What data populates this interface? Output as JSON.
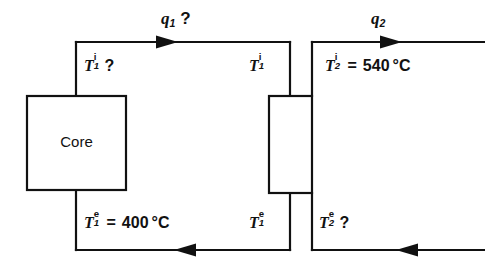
{
  "diagram": {
    "stroke_color": "#111111",
    "background_color": "#ffffff",
    "blocks": [
      {
        "id": "core",
        "label": "Core"
      },
      {
        "id": "heat-exchanger",
        "label": ""
      }
    ],
    "flow_labels": [
      {
        "id": "q1",
        "symbol": "q",
        "subscript": "1",
        "suffix": "?",
        "text": "q1 ?"
      },
      {
        "id": "q2",
        "symbol": "q",
        "subscript": "2",
        "suffix": "",
        "text": "q2"
      }
    ],
    "temperature_labels": [
      {
        "id": "t1-inlet-core",
        "symbol": "T",
        "superscript": "i",
        "subscript": "1",
        "equals": "",
        "value": "",
        "unit": "",
        "suffix": "?",
        "text": "T1i ?"
      },
      {
        "id": "t1-inlet-hx",
        "symbol": "T",
        "superscript": "i",
        "subscript": "1",
        "equals": "",
        "value": "",
        "unit": "",
        "suffix": "",
        "text": "T1i"
      },
      {
        "id": "t2-inlet",
        "symbol": "T",
        "superscript": "i",
        "subscript": "2",
        "equals": "=",
        "value": "540",
        "unit": "°C",
        "suffix": "",
        "text": "T2i = 540 °C"
      },
      {
        "id": "t1-exit-core",
        "symbol": "T",
        "superscript": "e",
        "subscript": "1",
        "equals": "=",
        "value": "400",
        "unit": "°C",
        "suffix": "",
        "text": "T1e = 400 °C"
      },
      {
        "id": "t1-exit-hx",
        "symbol": "T",
        "superscript": "e",
        "subscript": "1",
        "equals": "",
        "value": "",
        "unit": "",
        "suffix": "",
        "text": "T1e"
      },
      {
        "id": "t2-exit",
        "symbol": "T",
        "superscript": "e",
        "subscript": "2",
        "equals": "",
        "value": "",
        "unit": "",
        "suffix": "?",
        "text": "T2e ?"
      }
    ],
    "arrows": [
      {
        "id": "top-left-arrow",
        "direction": "right"
      },
      {
        "id": "top-right-arrow",
        "direction": "right"
      },
      {
        "id": "bottom-left-arrow",
        "direction": "left"
      },
      {
        "id": "bottom-right-arrow",
        "direction": "left"
      }
    ]
  }
}
